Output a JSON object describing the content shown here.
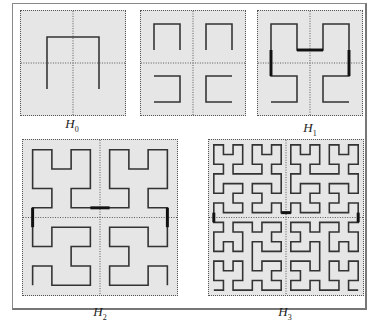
{
  "figure": {
    "panels": [
      {
        "id": "H0",
        "label": "H",
        "sub": "0",
        "order": 0,
        "box": [
          20,
          10,
          106,
          106
        ],
        "labelPos": [
          52,
          116
        ]
      },
      {
        "id": "H1-split",
        "label": "",
        "sub": "",
        "order": 1,
        "split": true,
        "box": [
          140,
          10,
          106,
          106
        ],
        "labelPos": null
      },
      {
        "id": "H1",
        "label": "H",
        "sub": "1",
        "order": 1,
        "box": [
          257,
          10,
          106,
          106
        ],
        "labelPos": [
          290,
          120
        ]
      },
      {
        "id": "H2",
        "label": "H",
        "sub": "2",
        "order": 2,
        "box": [
          22,
          139,
          156,
          157
        ],
        "labelPos": [
          80,
          304
        ]
      },
      {
        "id": "H3",
        "label": "H",
        "sub": "3",
        "order": 3,
        "box": [
          208,
          139,
          156,
          157
        ],
        "labelPos": [
          265,
          304
        ]
      }
    ],
    "colors": {
      "background": "#e6e6e6",
      "curve": "#333333",
      "connector": "#111111",
      "grid": "#555555"
    }
  }
}
